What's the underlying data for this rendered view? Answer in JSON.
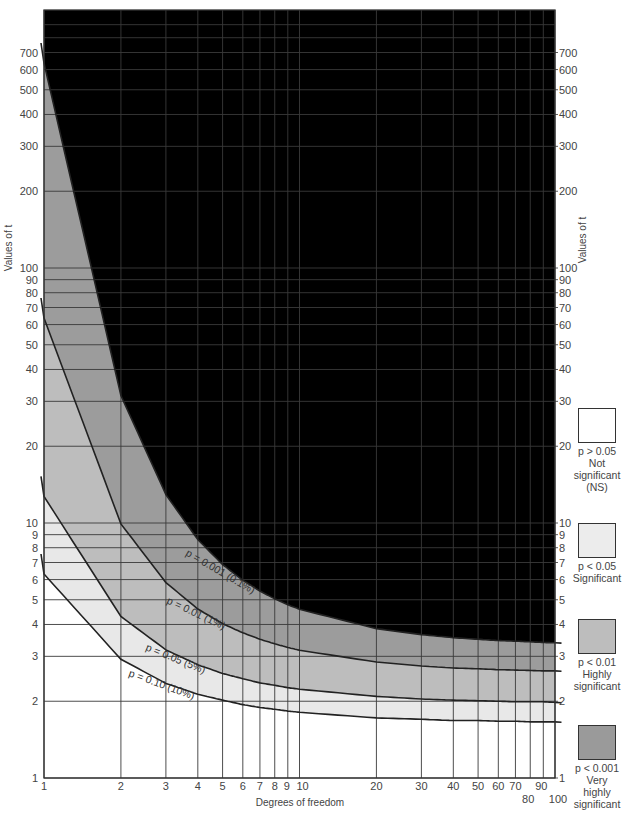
{
  "chart_data": {
    "type": "line",
    "title": "",
    "xlabel": "Degrees of freedom",
    "ylabel": "Values of t",
    "xscale": "log",
    "yscale": "log",
    "xlim": [
      1,
      100
    ],
    "ylim": [
      1,
      1000
    ],
    "grid": true,
    "x_ticks": [
      1,
      2,
      3,
      4,
      5,
      6,
      7,
      8,
      9,
      10,
      20,
      30,
      40,
      50,
      60,
      70,
      80,
      90,
      100
    ],
    "y_ticks": [
      1,
      2,
      3,
      4,
      5,
      6,
      7,
      8,
      9,
      10,
      20,
      30,
      40,
      50,
      60,
      70,
      80,
      90,
      100,
      200,
      300,
      400,
      500,
      600,
      700
    ],
    "x": [
      1,
      2,
      3,
      4,
      5,
      6,
      7,
      8,
      9,
      10,
      20,
      30,
      40,
      50,
      60,
      70,
      80,
      90,
      100
    ],
    "series": [
      {
        "name": "p = 0.10 (10%)",
        "values": [
          6.31,
          2.92,
          2.35,
          2.13,
          2.02,
          1.94,
          1.89,
          1.86,
          1.83,
          1.81,
          1.72,
          1.7,
          1.68,
          1.68,
          1.67,
          1.67,
          1.66,
          1.66,
          1.66
        ]
      },
      {
        "name": "p = 0.05 (5%)",
        "values": [
          12.71,
          4.3,
          3.18,
          2.78,
          2.57,
          2.45,
          2.36,
          2.31,
          2.26,
          2.23,
          2.09,
          2.04,
          2.02,
          2.01,
          2.0,
          1.99,
          1.99,
          1.99,
          1.98
        ]
      },
      {
        "name": "p = 0.01 (1%)",
        "values": [
          63.66,
          9.92,
          5.84,
          4.6,
          4.03,
          3.71,
          3.5,
          3.36,
          3.25,
          3.17,
          2.85,
          2.75,
          2.7,
          2.68,
          2.66,
          2.65,
          2.64,
          2.63,
          2.63
        ]
      },
      {
        "name": "p = 0.001 (0.1%)",
        "values": [
          636.6,
          31.6,
          12.92,
          8.61,
          6.87,
          5.96,
          5.41,
          5.04,
          4.78,
          4.59,
          3.85,
          3.65,
          3.55,
          3.5,
          3.46,
          3.44,
          3.42,
          3.4,
          3.39
        ]
      }
    ],
    "regions": [
      {
        "label": "Not significant (NS)",
        "condition": "p > 0.05",
        "color": "#ffffff"
      },
      {
        "label": "Significant",
        "condition": "p < 0.05",
        "color": "#e8e8e8"
      },
      {
        "label": "Highly significant",
        "condition": "p < 0.01",
        "color": "#bdbdbd"
      },
      {
        "label": "Very highly significant",
        "condition": "p < 0.001",
        "color": "#9c9c9c"
      }
    ],
    "legend_position": "right"
  },
  "labels": {
    "x_axis": "Degrees of freedom",
    "y_axis_left": "Values of t",
    "y_axis_right": "Values of t",
    "curve_labels": [
      "p = 0.10 (10%)",
      "p = 0.05 (5%)",
      "p = 0.01 (1%)",
      "p = 0.001 (0.1%)"
    ]
  },
  "legend": [
    {
      "condition": "p > 0.05",
      "lines": [
        "Not",
        "significant",
        "(NS)"
      ],
      "color": "#ffffff"
    },
    {
      "condition": "p < 0.05",
      "lines": [
        "Significant"
      ],
      "color": "#ececec"
    },
    {
      "condition": "p < 0.01",
      "lines": [
        "Highly",
        "significant"
      ],
      "color": "#bdbdbd"
    },
    {
      "condition": "p < 0.001",
      "lines": [
        "Very",
        "highly",
        "significant"
      ],
      "color": "#9a9a9a"
    }
  ]
}
